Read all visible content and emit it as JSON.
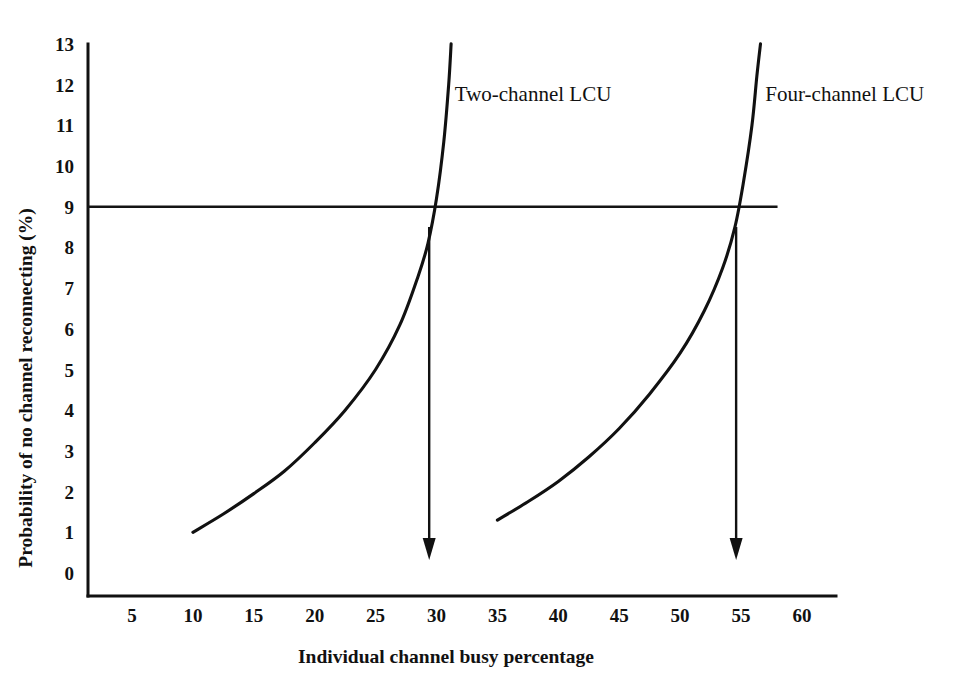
{
  "chart_data": {
    "type": "line",
    "title": "",
    "xlabel": "Individual channel busy percentage",
    "ylabel": "Probability of no channel reconnecting (%)",
    "xlim": [
      2.5,
      62.5
    ],
    "ylim": [
      0,
      13
    ],
    "grid": false,
    "legend_position": "inline-annotation",
    "xticks": [
      5,
      10,
      15,
      20,
      25,
      30,
      35,
      40,
      45,
      50,
      55,
      60
    ],
    "xtick_labels": [
      "5",
      "10",
      "15",
      "20",
      "25",
      "30",
      "35",
      "40",
      "45",
      "50",
      "55",
      "60"
    ],
    "yticks": [
      0,
      1,
      2,
      3,
      4,
      5,
      6,
      7,
      8,
      9,
      10,
      11,
      12,
      13
    ],
    "ytick_labels": [
      "0",
      "1",
      "2",
      "3",
      "4",
      "5",
      "6",
      "7",
      "8",
      "9",
      "10",
      "11",
      "12",
      "13"
    ],
    "series": [
      {
        "name": "Two-channel LCU",
        "label": "Two-channel LCU",
        "x": [
          10.0,
          12.5,
          15.0,
          17.5,
          20.0,
          22.5,
          25.0,
          27.0,
          28.5,
          29.3,
          30.0,
          30.6,
          31.0,
          31.2
        ],
        "y": [
          1.0,
          1.45,
          1.95,
          2.5,
          3.2,
          4.0,
          5.0,
          6.1,
          7.3,
          8.1,
          9.2,
          10.6,
          12.0,
          13.0
        ]
      },
      {
        "name": "Four-channel LCU",
        "label": "Four-channel LCU",
        "x": [
          35.0,
          37.5,
          40.0,
          42.5,
          45.0,
          47.5,
          50.0,
          52.0,
          53.5,
          54.5,
          55.2,
          55.9,
          56.3,
          56.6
        ],
        "y": [
          1.3,
          1.75,
          2.25,
          2.85,
          3.55,
          4.4,
          5.4,
          6.45,
          7.5,
          8.5,
          9.6,
          11.0,
          12.2,
          13.0
        ]
      }
    ],
    "reference_line": {
      "name": "nine-percent-threshold",
      "axis": "y",
      "value": 9,
      "x_start": 2.5,
      "x_end": 58.0
    },
    "annotations": [
      {
        "name": "two-channel-label",
        "text": "Two-channel LCU",
        "x": 31.5,
        "y": 11.6
      },
      {
        "name": "four-channel-label",
        "text": "Four-channel LCU",
        "x": 57.0,
        "y": 11.6
      }
    ],
    "markers": [
      {
        "name": "two-channel-crossing-arrow",
        "type": "down-arrow",
        "x": 29.4,
        "y_start": 8.5,
        "y_end": 0.32,
        "indicates": 29.4
      },
      {
        "name": "four-channel-crossing-arrow",
        "type": "down-arrow",
        "x": 54.6,
        "y_start": 8.5,
        "y_end": 0.32,
        "indicates": 54.6
      }
    ],
    "colors": {
      "curve": "#111111",
      "reference_line": "#141414",
      "arrow": "#111111",
      "axis": "#111111",
      "background": "#ffffff"
    }
  }
}
